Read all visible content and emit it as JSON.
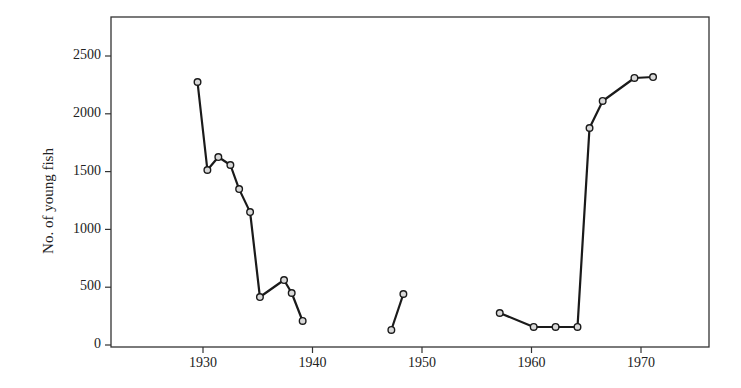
{
  "chart_data": {
    "type": "line",
    "title": "",
    "xlabel": "",
    "ylabel": "No. of young fish",
    "xlim": [
      1922,
      1976.5
    ],
    "ylim": [
      0,
      2800
    ],
    "xticks": [
      1930,
      1940,
      1950,
      1960,
      1970
    ],
    "yticks": [
      0,
      500,
      1000,
      1500,
      2000,
      2500
    ],
    "grid": false,
    "legend": null,
    "marker": "open-circle",
    "line_color": "#1a1a1a",
    "segments": [
      {
        "x": [
          1929.5,
          1930.4,
          1931.4,
          1932.5,
          1933.3,
          1934.3,
          1935.2,
          1937.4,
          1938.1,
          1939.1
        ],
        "y": [
          2275,
          1514,
          1626,
          1557,
          1349,
          1150,
          415,
          562,
          450,
          208
        ]
      },
      {
        "x": [
          1947.2,
          1948.3
        ],
        "y": [
          130,
          441
        ]
      },
      {
        "x": [
          1957.1,
          1960.2,
          1962.2,
          1964.2,
          1965.3,
          1966.5,
          1969.4,
          1971.1
        ],
        "y": [
          277,
          156,
          156,
          156,
          1877,
          2111,
          2310,
          2318
        ]
      }
    ]
  }
}
